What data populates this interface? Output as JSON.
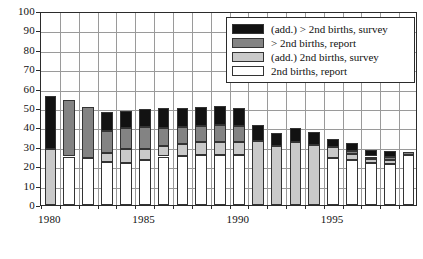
{
  "chart_data": {
    "type": "bar",
    "stacked": true,
    "title": "",
    "subtitle": "",
    "xlabel": "",
    "ylabel": "",
    "ylim": [
      0,
      100
    ],
    "ytick_step": 10,
    "yticks": [
      0,
      10,
      20,
      30,
      40,
      50,
      60,
      70,
      80,
      90,
      100
    ],
    "grid": true,
    "grid_axis": "both",
    "legend_position": "top-right",
    "categories": [
      1980,
      1981,
      1982,
      1983,
      1984,
      1985,
      1986,
      1987,
      1988,
      1989,
      1990,
      1991,
      1992,
      1993,
      1994,
      1995,
      1996,
      1997,
      1998,
      1999
    ],
    "xtick_labels": [
      "1980",
      "1985",
      "1990",
      "1995"
    ],
    "xtick_categories": [
      1980,
      1985,
      1990,
      1995
    ],
    "series": [
      {
        "name": "2nd births, report",
        "color": "#ffffff",
        "values": [
          0,
          25,
          24,
          22,
          21.5,
          23,
          25,
          25.5,
          26,
          26,
          26,
          0,
          0,
          0,
          0,
          24,
          23,
          21.5,
          21,
          26
        ]
      },
      {
        "name": "(add.) 2nd births, survey",
        "color": "#c9c9c9",
        "values": [
          29,
          0,
          0,
          5,
          7.5,
          6,
          5.5,
          6,
          6.5,
          6.5,
          6.5,
          33,
          30.5,
          32.5,
          31,
          6,
          3.5,
          2,
          2,
          0
        ]
      },
      {
        "name": "> 2nd births, report",
        "color": "#838383",
        "values": [
          0,
          29,
          26.5,
          11,
          10.5,
          11,
          9,
          8.5,
          8,
          8.5,
          8,
          0,
          0,
          0,
          0,
          0,
          1.5,
          1.5,
          1.5,
          1.5
        ]
      },
      {
        "name": "(add.) > 2nd births, survey",
        "color": "#121212",
        "values": [
          27,
          0,
          0,
          10,
          9,
          9.5,
          10.5,
          10,
          10,
          10,
          9.5,
          8,
          6.5,
          7,
          6.5,
          4,
          4,
          3.5,
          3.5,
          0
        ]
      }
    ],
    "totals": [
      56,
      54,
      50.5,
      48,
      48.5,
      49.5,
      50,
      50,
      50.5,
      51,
      50,
      41,
      37,
      39.5,
      37.5,
      34,
      32,
      28.5,
      28,
      27.5
    ]
  },
  "legend": {
    "items": [
      {
        "label": "(add.) > 2nd births, survey",
        "swatch": "s3"
      },
      {
        "label": "> 2nd births, report",
        "swatch": "s2"
      },
      {
        "label": "(add.) 2nd births, survey",
        "swatch": "s1"
      },
      {
        "label": "2nd births, report",
        "swatch": "s0"
      }
    ]
  }
}
